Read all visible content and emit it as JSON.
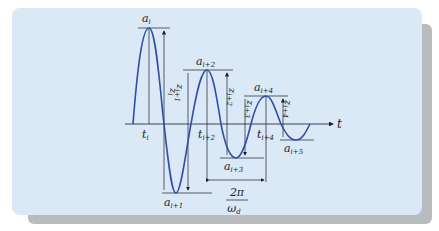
{
  "diagram": {
    "type": "damped-oscillation",
    "colors": {
      "curve": "#2e4fa8",
      "panel": "#dbe8f6",
      "shadow": "#b9bcbe",
      "lines": "#1b1f2a"
    },
    "axis": {
      "label": "t"
    },
    "peaks": [
      {
        "base": "a",
        "sub": "i"
      },
      {
        "base": "a",
        "sub": "i+1"
      },
      {
        "base": "a",
        "sub": "i+2"
      },
      {
        "base": "a",
        "sub": "i+3"
      },
      {
        "base": "a",
        "sub": "i+4"
      },
      {
        "base": "a",
        "sub": "i+5"
      }
    ],
    "times": [
      {
        "base": "t",
        "sub": "i"
      },
      {
        "base": "t",
        "sub": "i+2"
      },
      {
        "base": "t",
        "sub": "i+4"
      }
    ],
    "ranges": [
      {
        "base": "z",
        "sub": "i"
      },
      {
        "base": "z",
        "sub": "i+1"
      },
      {
        "base": "z",
        "sub": "i+2"
      },
      {
        "base": "z",
        "sub": "i+3"
      },
      {
        "base": "z",
        "sub": "i+4"
      }
    ],
    "period": {
      "numerator": "2π",
      "denominator": "ω",
      "denominator_sub": "d"
    }
  }
}
